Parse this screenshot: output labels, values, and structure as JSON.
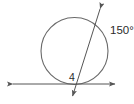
{
  "figure": {
    "type": "geometry-diagram",
    "width": 134,
    "height": 104,
    "background_color": "#ffffff",
    "stroke_color": "#555555",
    "text_color": "#2b2b2b"
  },
  "labels": {
    "arc_measure": "150°",
    "angle_number": "4"
  },
  "shapes": {
    "circle": {
      "name": "circle",
      "center_x": 74.5,
      "center_y": 51,
      "radius": 33.5
    },
    "secant_line": {
      "name": "secant-line",
      "x1": 101,
      "y1": 7,
      "x2": 72,
      "y2": 99,
      "arrow_start": true,
      "arrow_end": true
    },
    "horizontal_line": {
      "name": "horizontal-line",
      "x1": 12,
      "y1": 84,
      "x2": 116,
      "y2": 84,
      "arrow_start": true,
      "arrow_end": true
    },
    "intersection_point": {
      "name": "intersection-point",
      "x": 78,
      "y": 84
    }
  },
  "label_positions": {
    "arc_measure": {
      "x": 110,
      "y": 34
    },
    "angle_number": {
      "x": 69,
      "y": 81
    }
  }
}
